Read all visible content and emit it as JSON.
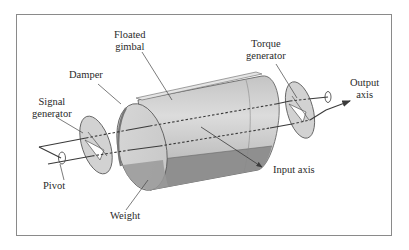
{
  "diagram": {
    "labels": {
      "floated_gimbal": [
        "Floated",
        "gimbal"
      ],
      "damper": "Damper",
      "signal_generator": [
        "Signal",
        "generator"
      ],
      "pivot": "Pivot",
      "weight": "Weight",
      "torque_generator": [
        "Torque",
        "generator"
      ],
      "output_axis": [
        "Output",
        "axis"
      ],
      "input_axis": "Input axis"
    },
    "colors": {
      "frame": "#8a8a8a",
      "line": "#3a3a3a",
      "cylinder_light": "#d8d8d8",
      "cylinder_mid": "#b8b8b8",
      "weight": "#8f8f8f",
      "disc": "#d0d0d0"
    }
  }
}
